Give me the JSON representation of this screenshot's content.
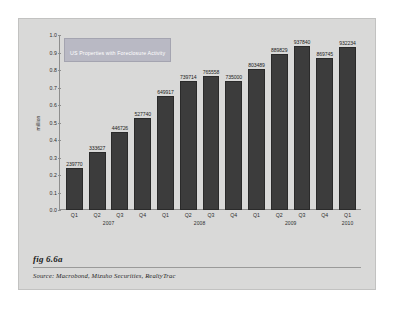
{
  "figure": {
    "number": "fig 6.6a",
    "source": "Source:  Macrobond, Mizuho Securities, RealtyTrac"
  },
  "chart_data": {
    "type": "bar",
    "title": "US Properties with Foreclosure Activity",
    "legend_label": "US Properties with Foreclosure Activity",
    "legend_position": "top-left-inside",
    "xlabel": "",
    "ylabel": "million",
    "ylim": [
      0.0,
      1.0
    ],
    "grid": false,
    "ytick_labels": [
      "1.0",
      "0.9",
      "0.8",
      "0.7",
      "0.6",
      "0.5",
      "0.4",
      "0.3",
      "0.2",
      "0.1",
      "0.0"
    ],
    "ytick_values": [
      1.0,
      0.9,
      0.8,
      0.7,
      0.6,
      0.5,
      0.4,
      0.3,
      0.2,
      0.1,
      0.0
    ],
    "categories": [
      "Q1",
      "Q2",
      "Q3",
      "Q4",
      "Q1",
      "Q2",
      "Q3",
      "Q4",
      "Q1",
      "Q2",
      "Q3",
      "Q4",
      "Q1"
    ],
    "year_groups": [
      {
        "label": "2007",
        "span_start": 0,
        "span_end": 3
      },
      {
        "label": "2008",
        "span_start": 4,
        "span_end": 7
      },
      {
        "label": "2009",
        "span_start": 8,
        "span_end": 11
      },
      {
        "label": "2010",
        "span_start": 12,
        "span_end": 12
      }
    ],
    "values": [
      239770,
      333627,
      446726,
      527740,
      649917,
      739714,
      765558,
      735000,
      803489,
      889829,
      937840,
      869745,
      932234
    ],
    "value_labels": [
      "239770",
      "333627",
      "446726",
      "527740",
      "649917",
      "739714",
      "765558",
      "735000",
      "803489",
      "889829",
      "937840",
      "869745",
      "932234"
    ],
    "units": "properties",
    "value_scale_note": "bar heights plotted in millions on y-axis",
    "bar_color": "#3c3c3c",
    "panel_color": "#d9d9d8",
    "legend_bg_color": "#b9b9c4",
    "axis_color": "#8e8e8d"
  },
  "bars": [
    {
      "q": "Q1",
      "year": "2007",
      "label": "239770",
      "value": 0.23977
    },
    {
      "q": "Q2",
      "year": "2007",
      "label": "333627",
      "value": 0.333627
    },
    {
      "q": "Q3",
      "year": "2007",
      "label": "446726",
      "value": 0.446726
    },
    {
      "q": "Q4",
      "year": "2007",
      "label": "527740",
      "value": 0.52774
    },
    {
      "q": "Q1",
      "year": "2008",
      "label": "649917",
      "value": 0.649917
    },
    {
      "q": "Q2",
      "year": "2008",
      "label": "739714",
      "value": 0.739714
    },
    {
      "q": "Q3",
      "year": "2008",
      "label": "765558",
      "value": 0.765558
    },
    {
      "q": "Q4",
      "year": "2008",
      "label": "735000",
      "value": 0.735
    },
    {
      "q": "Q1",
      "year": "2009",
      "label": "803489",
      "value": 0.803489
    },
    {
      "q": "Q2",
      "year": "2009",
      "label": "889829",
      "value": 0.889829
    },
    {
      "q": "Q3",
      "year": "2009",
      "label": "937840",
      "value": 0.93784
    },
    {
      "q": "Q4",
      "year": "2009",
      "label": "869745",
      "value": 0.869745
    },
    {
      "q": "Q1",
      "year": "2010",
      "label": "932234",
      "value": 0.932234
    }
  ]
}
